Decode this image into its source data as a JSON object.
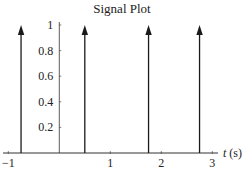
{
  "chart_data": {
    "type": "impulse",
    "title": "Signal Plot",
    "xlabel": "t (s)",
    "xlabel_var": "t",
    "xlabel_unit": " (s)",
    "ylabel": "",
    "xlim": [
      -1,
      3
    ],
    "ylim": [
      0,
      1
    ],
    "x_ticks": [
      -1,
      1,
      2,
      3
    ],
    "x_tick_labels": [
      "−1",
      "1",
      "2",
      "3"
    ],
    "y_ticks": [
      0.2,
      0.4,
      0.6,
      0.8,
      1
    ],
    "y_tick_labels": [
      "0.2",
      "0.4",
      "0.6",
      "0.8",
      "1"
    ],
    "grid": false,
    "legend": null,
    "series": [
      {
        "name": "impulses",
        "x": [
          -0.75,
          0.5,
          1.75,
          2.75
        ],
        "values": [
          1,
          1,
          1,
          1
        ]
      }
    ],
    "colors": {
      "axis": "#333333",
      "impulse": "#1a1a1a",
      "text": "#222222"
    }
  }
}
